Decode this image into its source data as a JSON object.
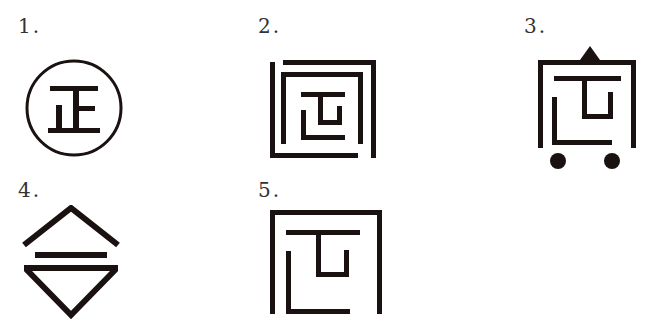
{
  "figures": [
    {
      "number": "1.",
      "description": "Circle enclosing the character 正",
      "character": "正"
    },
    {
      "number": "2.",
      "description": "Square maze of nested partial frames with 正-like center"
    },
    {
      "number": "3.",
      "description": "Cart-like frame with triangle on top and two wheels"
    },
    {
      "number": "4.",
      "description": "Diamond split into upward and downward chevrons with a bar"
    },
    {
      "number": "5.",
      "description": "Square frame with 正-like maze inside"
    }
  ],
  "colors": {
    "ink": "#1a1210",
    "label": "#333333"
  }
}
